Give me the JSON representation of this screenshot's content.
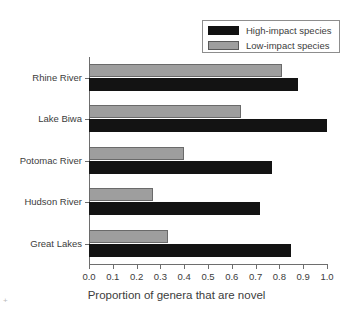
{
  "chart_data": {
    "type": "bar",
    "orientation": "horizontal",
    "title": "",
    "xlabel": "Proportion of genera that are novel",
    "ylabel": "",
    "xlim": [
      0.0,
      1.0
    ],
    "xticks": [
      "0.0",
      "0.1",
      "0.2",
      "0.3",
      "0.4",
      "0.5",
      "0.6",
      "0.7",
      "0.8",
      "0.9",
      "1.0"
    ],
    "xtick_values": [
      0.0,
      0.1,
      0.2,
      0.3,
      0.4,
      0.5,
      0.6,
      0.7,
      0.8,
      0.9,
      1.0
    ],
    "grid": false,
    "legend_position": "top-right",
    "categories": [
      "Rhine River",
      "Lake Biwa",
      "Potomac River",
      "Hudson River",
      "Great Lakes"
    ],
    "series": [
      {
        "name": "High-impact species",
        "color": "#131313",
        "values": [
          0.88,
          1.0,
          0.77,
          0.72,
          0.85
        ]
      },
      {
        "name": "Low-impact species",
        "color": "#9e9e9e",
        "values": [
          0.81,
          0.64,
          0.4,
          0.27,
          0.33
        ]
      }
    ]
  },
  "legend": {
    "entries": [
      {
        "label": "High-impact species",
        "swatch": "high"
      },
      {
        "label": "Low-impact species",
        "swatch": "low"
      }
    ]
  }
}
